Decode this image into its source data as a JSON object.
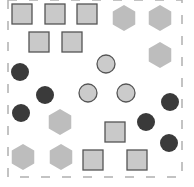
{
  "scene": {
    "width": 194,
    "height": 187,
    "background": "#ffffff",
    "frame": {
      "x1": 8,
      "y1": 0,
      "x2": 182,
      "y2": 177,
      "color": "#b0b0b0",
      "dash": "9,12"
    },
    "colors": {
      "square_fill": "#c9c9c9",
      "square_stroke": "#555555",
      "hexagon_fill": "#bdbdbd",
      "dark_circle_fill": "#3a3a3a",
      "light_circle_fill": "#cbcbcb",
      "light_circle_stroke": "#555555"
    },
    "squares": [
      {
        "cx": 22,
        "cy": 14,
        "size": 20
      },
      {
        "cx": 55,
        "cy": 14,
        "size": 20
      },
      {
        "cx": 87,
        "cy": 14,
        "size": 20
      },
      {
        "cx": 39,
        "cy": 42,
        "size": 20
      },
      {
        "cx": 72,
        "cy": 42,
        "size": 20
      },
      {
        "cx": 115,
        "cy": 132,
        "size": 20
      },
      {
        "cx": 93,
        "cy": 160,
        "size": 20
      },
      {
        "cx": 137,
        "cy": 160,
        "size": 20
      }
    ],
    "hexagons": [
      {
        "cx": 124,
        "cy": 18,
        "r": 13
      },
      {
        "cx": 160,
        "cy": 18,
        "r": 13
      },
      {
        "cx": 160,
        "cy": 55,
        "r": 13
      },
      {
        "cx": 60,
        "cy": 122,
        "r": 13
      },
      {
        "cx": 23,
        "cy": 157,
        "r": 13
      },
      {
        "cx": 61,
        "cy": 157,
        "r": 13
      }
    ],
    "dark_circles": [
      {
        "cx": 20,
        "cy": 72,
        "r": 9
      },
      {
        "cx": 45,
        "cy": 95,
        "r": 9
      },
      {
        "cx": 170,
        "cy": 102,
        "r": 9
      },
      {
        "cx": 146,
        "cy": 122,
        "r": 9
      },
      {
        "cx": 21,
        "cy": 113,
        "r": 9
      },
      {
        "cx": 169,
        "cy": 143,
        "r": 9
      }
    ],
    "light_circles": [
      {
        "cx": 106,
        "cy": 64,
        "r": 9
      },
      {
        "cx": 88,
        "cy": 93,
        "r": 9
      },
      {
        "cx": 126,
        "cy": 93,
        "r": 9
      }
    ]
  }
}
